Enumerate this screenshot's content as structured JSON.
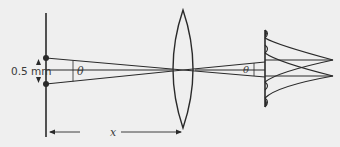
{
  "diagram": {
    "type": "optics-resolution",
    "labels": {
      "slit_separation": "0.5 mm",
      "angle_left": "θ",
      "angle_right": "θ",
      "distance": "x"
    },
    "elements": {
      "source_plane": "double point source (two dots)",
      "lens": "biconvex lens",
      "screen": "image screen with two diffraction patterns"
    },
    "colors": {
      "background": "#efefef",
      "stroke": "#2a2a2a",
      "text": "#3a3a3a"
    }
  }
}
